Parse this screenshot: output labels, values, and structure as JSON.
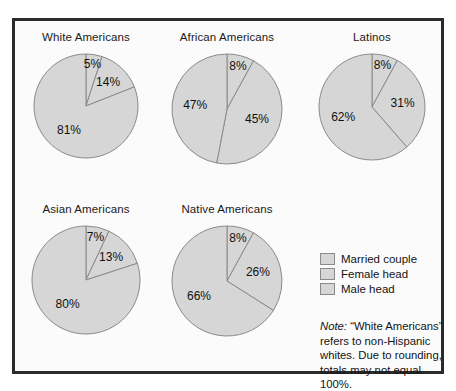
{
  "figure": {
    "background_color": "#fbfbfb",
    "border_color": "#2b2b2b",
    "slice_fill_color": "#d6d6d6",
    "slice_stroke_color": "#8a8a8a"
  },
  "legend": {
    "items": [
      {
        "label": "Married couple",
        "swatch": "#d6d6d6"
      },
      {
        "label": "Female head",
        "swatch": "#d6d6d6"
      },
      {
        "label": "Male head",
        "swatch": "#d6d6d6"
      }
    ]
  },
  "note": {
    "label": "Note:",
    "text": " “White Americans” refers to non-Hispanic whites. Due to rounding, totals may not equal 100%."
  },
  "chart_data": [
    {
      "type": "pie",
      "title": "White Americans",
      "categories": [
        "Male head",
        "Female head",
        "Married couple"
      ],
      "values": [
        5,
        14,
        81
      ],
      "labels": [
        "5%",
        "14%",
        "81%"
      ],
      "start_angle_deg": 0,
      "direction": "clockwise",
      "units": "percent"
    },
    {
      "type": "pie",
      "title": "African Americans",
      "categories": [
        "Male head",
        "Female head",
        "Married couple"
      ],
      "values": [
        8,
        45,
        47
      ],
      "labels": [
        "8%",
        "45%",
        "47%"
      ],
      "start_angle_deg": 0,
      "direction": "clockwise",
      "units": "percent"
    },
    {
      "type": "pie",
      "title": "Latinos",
      "categories": [
        "Male head",
        "Female head",
        "Married couple"
      ],
      "values": [
        8,
        31,
        62
      ],
      "labels": [
        "8%",
        "31%",
        "62%"
      ],
      "start_angle_deg": 0,
      "direction": "clockwise",
      "units": "percent"
    },
    {
      "type": "pie",
      "title": "Asian Americans",
      "categories": [
        "Male head",
        "Female head",
        "Married couple"
      ],
      "values": [
        7,
        13,
        80
      ],
      "labels": [
        "7%",
        "13%",
        "80%"
      ],
      "start_angle_deg": 0,
      "direction": "clockwise",
      "units": "percent"
    },
    {
      "type": "pie",
      "title": "Native Americans",
      "categories": [
        "Male head",
        "Female head",
        "Married couple"
      ],
      "values": [
        8,
        26,
        66
      ],
      "labels": [
        "8%",
        "26%",
        "66%"
      ],
      "start_angle_deg": 0,
      "direction": "clockwise",
      "units": "percent"
    }
  ]
}
